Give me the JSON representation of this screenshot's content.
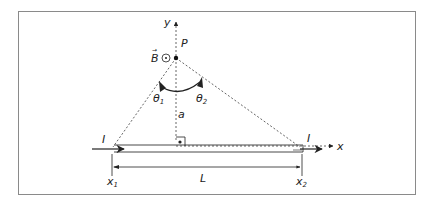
{
  "diagram": {
    "labels": {
      "y_axis": "y",
      "x_axis": "x",
      "point": "P",
      "field": "B",
      "field_vector_mark": "→",
      "theta1": "θ",
      "theta1_sub": "1",
      "theta2": "θ",
      "theta2_sub": "2",
      "distance": "a",
      "current_left": "I",
      "current_right": "I",
      "length": "L",
      "x1": "x",
      "x1_sub": "1",
      "x2": "x",
      "x2_sub": "2"
    },
    "symbols": {
      "field_direction": "out-of-page (circle-dot)",
      "right_angle_marker": "square with dot"
    },
    "colors": {
      "frame": "#8a8a8a",
      "lines": "#222222",
      "dashed": "#555555"
    }
  }
}
